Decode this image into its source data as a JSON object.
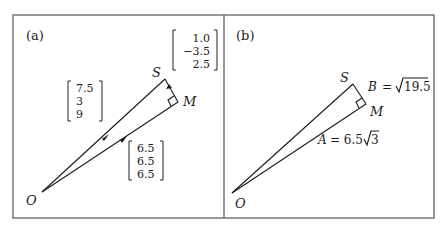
{
  "figure": {
    "panels": [
      {
        "id": "a",
        "label": "(a)",
        "points": {
          "origin": "O",
          "top": "S",
          "foot": "M"
        },
        "vectors": [
          {
            "name": "OS",
            "components": [
              "7.5",
              "3",
              "9"
            ]
          },
          {
            "name": "OM",
            "components": [
              "6.5",
              "6.5",
              "6.5"
            ]
          },
          {
            "name": "MS",
            "components": [
              "1.0",
              "−3.5",
              "2.5"
            ]
          }
        ]
      },
      {
        "id": "b",
        "label": "(b)",
        "points": {
          "origin": "O",
          "top": "S",
          "foot": "M"
        },
        "lengths": {
          "A": "A = 6.5√3",
          "B": "B = √19.5",
          "A_name": "A",
          "A_eq": "= 6.5",
          "A_rad": "3",
          "B_name": "B",
          "B_eq": "=",
          "B_rad": "19.5"
        }
      }
    ]
  }
}
